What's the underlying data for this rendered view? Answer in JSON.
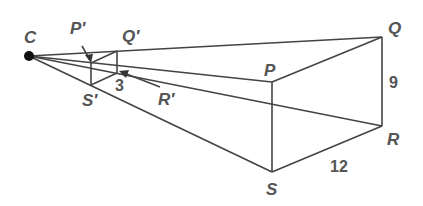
{
  "diagram": {
    "labels": {
      "C": "C",
      "P": "P",
      "Q": "Q",
      "R": "R",
      "S": "S",
      "P_prime": "P′",
      "Q_prime": "Q′",
      "R_prime": "R′",
      "S_prime": "S′"
    },
    "measurements": {
      "QR": "9",
      "SR": "12",
      "small_side": "3"
    },
    "colors": {
      "line": "#444444",
      "text": "#555555",
      "point": "#111111"
    }
  }
}
